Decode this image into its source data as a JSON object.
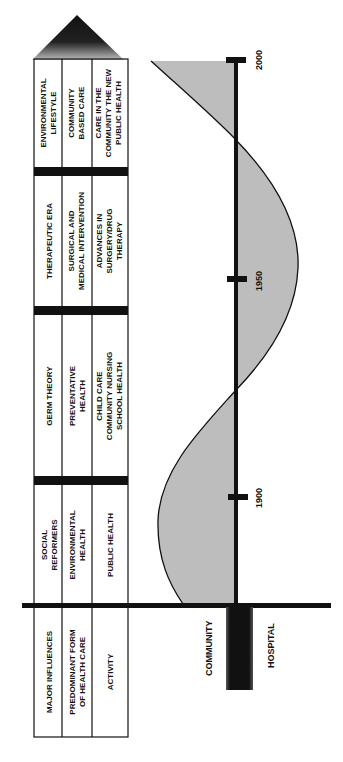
{
  "diagram": {
    "orientation": "rotated-90-ccw",
    "row_headers": [
      "MAJOR INFLUENCES",
      "PREDOMINANT FORM OF HEALTH CARE",
      "ACTIVITY"
    ],
    "row_headers_lines": [
      [
        "MAJOR INFLUENCES"
      ],
      [
        "PREDOMINANT FORM",
        "OF HEALTH CARE"
      ],
      [
        "ACTIVITY"
      ]
    ],
    "eras": [
      {
        "influence": [
          "SOCIAL",
          "REFORMERS"
        ],
        "form": [
          "ENVIRONMENTAL",
          "HEALTH"
        ],
        "activity": [
          "PUBLIC HEALTH"
        ]
      },
      {
        "influence": [
          "GERM THEORY"
        ],
        "form": [
          "PREVENTATIVE",
          "HEALTH"
        ],
        "activity": [
          "CHILD CARE",
          "COMMUNITY NURSING",
          "SCHOOL HEALTH"
        ]
      },
      {
        "influence": [
          "THERAPEUTIC ERA"
        ],
        "form": [
          "SURGICAL AND",
          "MEDICAL INTERVENTION"
        ],
        "activity": [
          "ADVANCES IN",
          "SURGERY/DRUG",
          "THERAPY"
        ]
      },
      {
        "influence": [
          "ENVIRONMENTAL",
          "LIFESTYLE"
        ],
        "form": [
          "COMMUNITY",
          "BASED CARE"
        ],
        "activity": [
          "CARE IN THE",
          "COMMUNITY THE NEW",
          "PUBLIC HEALTH"
        ]
      }
    ],
    "timeline": {
      "ticks": [
        "1900",
        "1950",
        "2000"
      ],
      "axis_labels": {
        "left": "COMMUNITY",
        "right": "HOSPITAL"
      }
    },
    "colors": {
      "line": "#111111",
      "fill": "#bdbdbd",
      "arrow": "#111111"
    }
  }
}
